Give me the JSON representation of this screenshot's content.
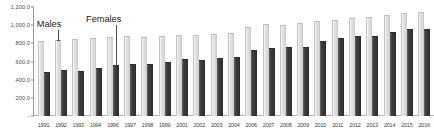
{
  "chart_data": {
    "type": "bar",
    "title": "",
    "subtitle": "",
    "xlabel": "",
    "ylabel": "",
    "ylim": [
      0,
      1200
    ],
    "grid": false,
    "legend_position": "inline-annotation",
    "categories": [
      "1991",
      "1992",
      "1993",
      "1994",
      "1996",
      "1997",
      "1998",
      "1999",
      "2001",
      "2002",
      "2003",
      "2004",
      "2006",
      "2007",
      "2008",
      "2009",
      "2010",
      "2011",
      "2012",
      "2013",
      "2014",
      "2015",
      "2016"
    ],
    "y_ticks": [
      0,
      200,
      400,
      600,
      800,
      1000,
      1200
    ],
    "y_tick_labels": [
      "-",
      "200.0",
      "400.0",
      "600.0",
      "800.0",
      "1,000.0",
      "1,200.0"
    ],
    "series": [
      {
        "name": "Males",
        "color": "#dcdcdc",
        "values": [
          830,
          840,
          845,
          860,
          870,
          880,
          875,
          880,
          895,
          895,
          905,
          915,
          985,
          1010,
          1005,
          1020,
          1045,
          1055,
          1080,
          1085,
          1115,
          1135,
          1140
        ]
      },
      {
        "name": "Females",
        "color": "#353535",
        "values": [
          490,
          505,
          500,
          525,
          560,
          570,
          575,
          600,
          625,
          615,
          635,
          655,
          730,
          745,
          760,
          765,
          830,
          855,
          880,
          885,
          925,
          960,
          955
        ]
      }
    ],
    "annotations": [
      {
        "text": "Males",
        "target_category": "1992",
        "target_series": "Males"
      },
      {
        "text": "Females",
        "target_category": "1996",
        "target_series": "Females"
      }
    ]
  }
}
